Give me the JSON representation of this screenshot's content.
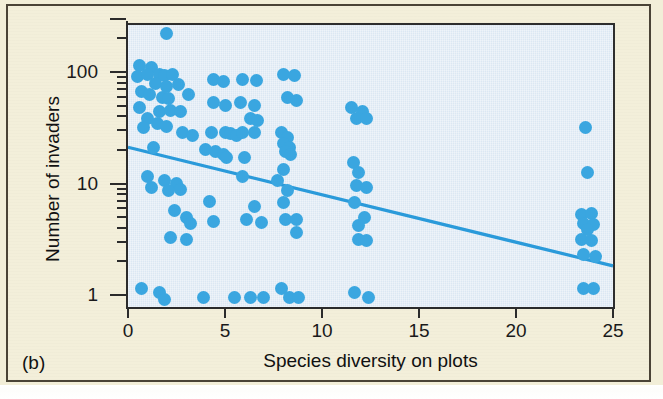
{
  "figure": {
    "panel_letter": "(b)",
    "accent_color": "#3aa6e0",
    "plot_background": "#dbe7f3",
    "page_background": "#f3efda"
  },
  "chart_data": {
    "type": "scatter",
    "title": "",
    "xlabel": "Species diversity on plots",
    "ylabel": "Number of invaders",
    "xlim": [
      0,
      25
    ],
    "ylim": [
      0.8,
      300
    ],
    "yscale": "log",
    "xscale": "linear",
    "grid": false,
    "legend": null,
    "xticks": [
      0,
      5,
      10,
      15,
      20,
      25
    ],
    "xtick_labels": [
      "0",
      "5",
      "10",
      "15",
      "20",
      "25"
    ],
    "yticks": [
      1,
      10,
      100
    ],
    "ytick_labels": [
      "1",
      "10",
      "100"
    ],
    "yminor_ticks": [
      2,
      3,
      4,
      5,
      6,
      7,
      8,
      9,
      20,
      30,
      40,
      50,
      60,
      70,
      80,
      90,
      200
    ],
    "marker_color": "#3aa6e0",
    "marker_size": 13,
    "trendline": {
      "type": "linear-on-log-y",
      "color": "#2a9ada",
      "x": [
        0,
        25
      ],
      "y": [
        22,
        1.9
      ]
    },
    "points": [
      {
        "x": 2.0,
        "y": 230
      },
      {
        "x": 0.6,
        "y": 120
      },
      {
        "x": 0.5,
        "y": 95
      },
      {
        "x": 1.2,
        "y": 115
      },
      {
        "x": 1.0,
        "y": 100
      },
      {
        "x": 1.6,
        "y": 100
      },
      {
        "x": 1.9,
        "y": 96
      },
      {
        "x": 2.3,
        "y": 100
      },
      {
        "x": 1.4,
        "y": 82
      },
      {
        "x": 2.0,
        "y": 78
      },
      {
        "x": 2.6,
        "y": 80
      },
      {
        "x": 0.7,
        "y": 70
      },
      {
        "x": 1.1,
        "y": 66
      },
      {
        "x": 1.8,
        "y": 62
      },
      {
        "x": 2.1,
        "y": 60
      },
      {
        "x": 3.1,
        "y": 66
      },
      {
        "x": 0.6,
        "y": 50
      },
      {
        "x": 1.6,
        "y": 46
      },
      {
        "x": 2.2,
        "y": 47
      },
      {
        "x": 2.7,
        "y": 46
      },
      {
        "x": 1.0,
        "y": 40
      },
      {
        "x": 1.5,
        "y": 36
      },
      {
        "x": 2.0,
        "y": 34
      },
      {
        "x": 0.8,
        "y": 33
      },
      {
        "x": 2.8,
        "y": 30
      },
      {
        "x": 3.3,
        "y": 28
      },
      {
        "x": 1.3,
        "y": 22
      },
      {
        "x": 4.0,
        "y": 21
      },
      {
        "x": 4.5,
        "y": 20
      },
      {
        "x": 4.9,
        "y": 19
      },
      {
        "x": 5.1,
        "y": 18
      },
      {
        "x": 1.0,
        "y": 12
      },
      {
        "x": 1.9,
        "y": 11
      },
      {
        "x": 2.5,
        "y": 10.5
      },
      {
        "x": 1.2,
        "y": 9.5
      },
      {
        "x": 2.1,
        "y": 9.0
      },
      {
        "x": 2.7,
        "y": 9.2
      },
      {
        "x": 2.4,
        "y": 6.0
      },
      {
        "x": 3.0,
        "y": 5.2
      },
      {
        "x": 3.2,
        "y": 4.6
      },
      {
        "x": 2.2,
        "y": 3.4
      },
      {
        "x": 3.0,
        "y": 3.3
      },
      {
        "x": 0.7,
        "y": 1.2
      },
      {
        "x": 1.6,
        "y": 1.1
      },
      {
        "x": 1.9,
        "y": 0.95
      },
      {
        "x": 3.9,
        "y": 1.0
      },
      {
        "x": 4.4,
        "y": 90
      },
      {
        "x": 4.9,
        "y": 86
      },
      {
        "x": 4.4,
        "y": 56
      },
      {
        "x": 5.0,
        "y": 52
      },
      {
        "x": 4.3,
        "y": 30
      },
      {
        "x": 5.0,
        "y": 30
      },
      {
        "x": 5.3,
        "y": 29
      },
      {
        "x": 5.6,
        "y": 28
      },
      {
        "x": 4.2,
        "y": 7.2
      },
      {
        "x": 4.4,
        "y": 4.8
      },
      {
        "x": 5.5,
        "y": 1.0
      },
      {
        "x": 6.3,
        "y": 1.0
      },
      {
        "x": 5.9,
        "y": 90
      },
      {
        "x": 6.6,
        "y": 88
      },
      {
        "x": 5.8,
        "y": 55
      },
      {
        "x": 6.5,
        "y": 52
      },
      {
        "x": 6.3,
        "y": 40
      },
      {
        "x": 6.7,
        "y": 38
      },
      {
        "x": 5.9,
        "y": 30
      },
      {
        "x": 6.5,
        "y": 30
      },
      {
        "x": 6.0,
        "y": 18
      },
      {
        "x": 5.9,
        "y": 12
      },
      {
        "x": 6.5,
        "y": 6.5
      },
      {
        "x": 6.1,
        "y": 5.0
      },
      {
        "x": 6.9,
        "y": 4.7
      },
      {
        "x": 7.0,
        "y": 1.0
      },
      {
        "x": 8.0,
        "y": 100
      },
      {
        "x": 8.6,
        "y": 96
      },
      {
        "x": 8.2,
        "y": 62
      },
      {
        "x": 8.7,
        "y": 58
      },
      {
        "x": 7.9,
        "y": 30
      },
      {
        "x": 8.2,
        "y": 27
      },
      {
        "x": 8.0,
        "y": 24
      },
      {
        "x": 8.3,
        "y": 22
      },
      {
        "x": 8.1,
        "y": 20
      },
      {
        "x": 8.4,
        "y": 19
      },
      {
        "x": 8.0,
        "y": 14
      },
      {
        "x": 7.7,
        "y": 11
      },
      {
        "x": 8.2,
        "y": 9.0
      },
      {
        "x": 8.0,
        "y": 7.0
      },
      {
        "x": 8.1,
        "y": 5.0
      },
      {
        "x": 8.7,
        "y": 5.0
      },
      {
        "x": 8.7,
        "y": 3.8
      },
      {
        "x": 7.9,
        "y": 1.2
      },
      {
        "x": 8.3,
        "y": 1.0
      },
      {
        "x": 8.8,
        "y": 1.0
      },
      {
        "x": 11.5,
        "y": 50
      },
      {
        "x": 12.1,
        "y": 46
      },
      {
        "x": 11.8,
        "y": 40
      },
      {
        "x": 12.3,
        "y": 40
      },
      {
        "x": 11.6,
        "y": 16
      },
      {
        "x": 11.9,
        "y": 13
      },
      {
        "x": 11.8,
        "y": 10
      },
      {
        "x": 12.3,
        "y": 9.5
      },
      {
        "x": 11.7,
        "y": 7.0
      },
      {
        "x": 12.2,
        "y": 5.2
      },
      {
        "x": 11.9,
        "y": 4.4
      },
      {
        "x": 11.9,
        "y": 3.3
      },
      {
        "x": 12.3,
        "y": 3.2
      },
      {
        "x": 11.7,
        "y": 1.1
      },
      {
        "x": 12.4,
        "y": 1.0
      },
      {
        "x": 23.6,
        "y": 33
      },
      {
        "x": 23.7,
        "y": 13
      },
      {
        "x": 23.4,
        "y": 5.5
      },
      {
        "x": 23.9,
        "y": 5.6
      },
      {
        "x": 23.5,
        "y": 4.6
      },
      {
        "x": 24.0,
        "y": 4.5
      },
      {
        "x": 23.7,
        "y": 4.0
      },
      {
        "x": 23.4,
        "y": 3.3
      },
      {
        "x": 23.9,
        "y": 3.2
      },
      {
        "x": 23.5,
        "y": 2.4
      },
      {
        "x": 24.1,
        "y": 2.3
      },
      {
        "x": 23.5,
        "y": 1.2
      },
      {
        "x": 24.0,
        "y": 1.2
      }
    ]
  }
}
